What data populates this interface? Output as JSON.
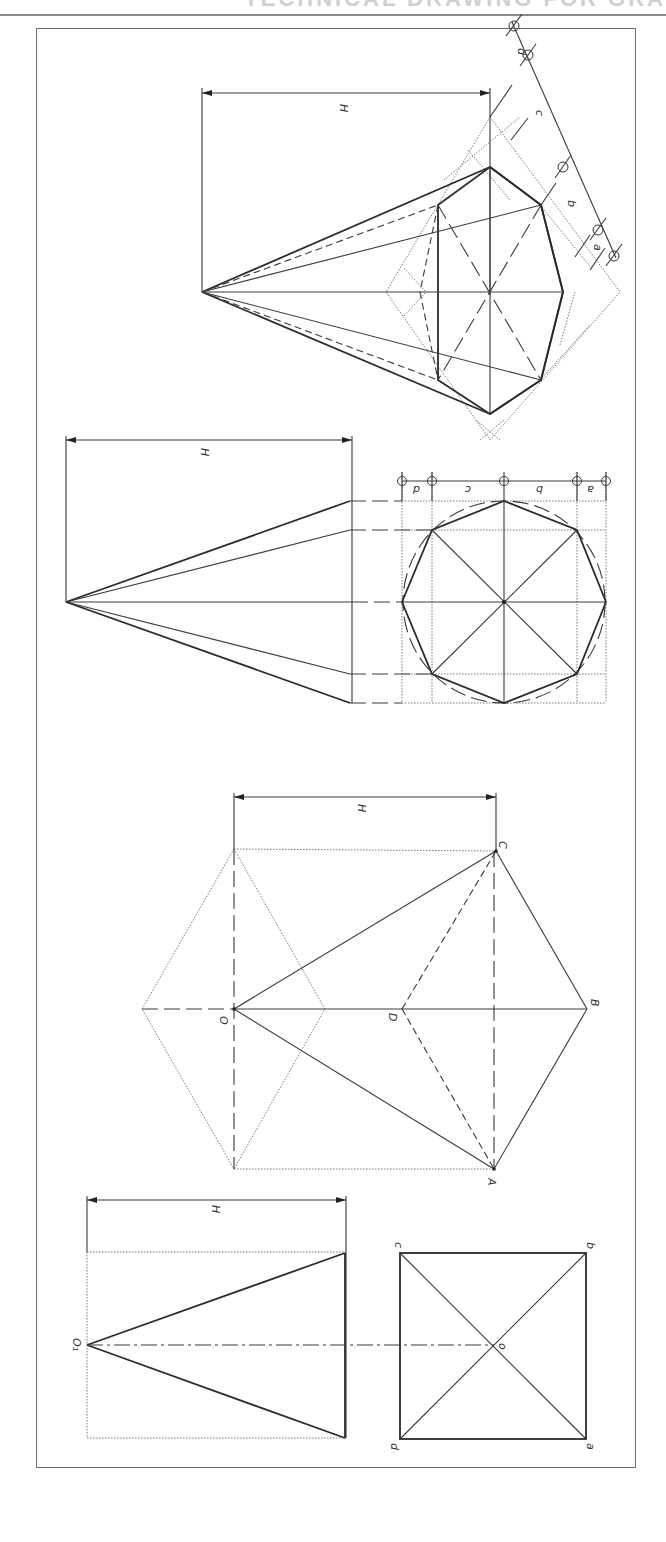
{
  "header": {
    "title_fragment": "TECHNICAL DRAWING FOR GRA"
  },
  "figures": [
    {
      "id": "fig-hex-pyramid-oblique",
      "dimension_label": "H",
      "division_labels": [
        "d",
        "c",
        "b",
        "a"
      ]
    },
    {
      "id": "fig-octagonal-pyramid",
      "dimension_label": "H",
      "division_labels": [
        "d",
        "c",
        "b",
        "a"
      ]
    },
    {
      "id": "fig-hex-pyramid-development",
      "dimension_label": "H",
      "vertex_labels": {
        "O": "O",
        "D": "D",
        "B": "B",
        "C": "C",
        "A": "A"
      }
    },
    {
      "id": "fig-square-pyramid",
      "dimension_label": "H",
      "apex_label": "O₁",
      "vertex_labels": {
        "a": "a",
        "b": "b",
        "c": "c",
        "d": "d",
        "o": "o"
      }
    }
  ],
  "colors": {
    "line": "#2b2b2b",
    "frame": "#6e6e6e",
    "rule": "#8a8a8a"
  }
}
